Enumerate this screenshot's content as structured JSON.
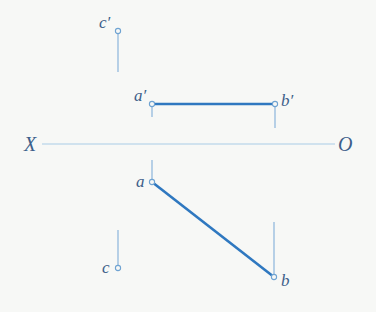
{
  "diagram": {
    "type": "orthographic-projection",
    "colors": {
      "background": "#f7f8f6",
      "thick_line": "#2f78c0",
      "thin_line": "#8ab5dc",
      "axis_line": "#a9cbe6",
      "label": "#3d5f8a"
    },
    "axis": {
      "left_label": "X",
      "right_label": "O",
      "x1": 42,
      "x2": 335,
      "y": 144
    },
    "points": {
      "c_prime": {
        "label": "c′",
        "x": 118,
        "y": 31
      },
      "a_prime": {
        "label": "a′",
        "x": 152,
        "y": 104
      },
      "b_prime": {
        "label": "b′",
        "x": 275,
        "y": 104
      },
      "a": {
        "label": "a",
        "x": 152,
        "y": 182
      },
      "b": {
        "label": "b",
        "x": 274,
        "y": 277
      },
      "c": {
        "label": "c",
        "x": 118,
        "y": 268
      }
    },
    "segments": [
      {
        "name": "a'b' (front view)",
        "from": "a_prime",
        "to": "b_prime",
        "style": "thick"
      },
      {
        "name": "ab (top view)",
        "from": "a",
        "to": "b",
        "style": "thick"
      }
    ],
    "projectors": [
      {
        "name": "c' projector",
        "x": 118,
        "y1": 31,
        "y2": 72
      },
      {
        "name": "a' projector",
        "x": 152,
        "y1": 104,
        "y2": 117
      },
      {
        "name": "b' projector",
        "x": 275,
        "y1": 104,
        "y2": 128
      },
      {
        "name": "a projector",
        "x": 152,
        "y1": 160,
        "y2": 182
      },
      {
        "name": "b projector",
        "x": 274,
        "y1": 222,
        "y2": 277
      },
      {
        "name": "c projector",
        "x": 118,
        "y1": 230,
        "y2": 268
      }
    ]
  }
}
